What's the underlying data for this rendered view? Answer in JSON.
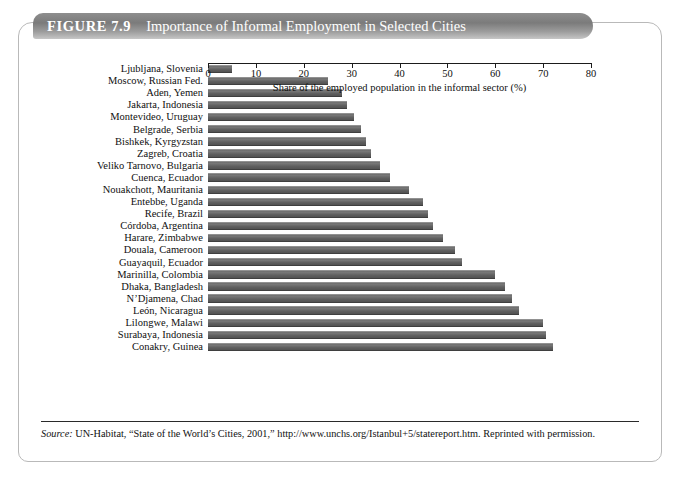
{
  "figure": {
    "label": "FIGURE 7.9",
    "title": "Importance of Informal Employment in Selected Cities"
  },
  "source": {
    "prefix": "Source:",
    "text": " UN-Habitat, “State of the World’s Cities, 2001,” http://www.unchs.org/Istanbul+5/statereport.htm. Reprinted with permission."
  },
  "colors": {
    "bar": "#666666",
    "banner_dark": "#7b7b7b",
    "banner_light": "#c6c6c6",
    "axis": "#1b1b1b",
    "card_border": "#b9b9b9"
  },
  "chart_data": {
    "type": "bar",
    "orientation": "horizontal",
    "title": "Importance of Informal Employment in Selected Cities",
    "xlabel": "Share of the employed population in the informal sector (%)",
    "ylabel": "",
    "xlim": [
      0,
      80
    ],
    "xticks": [
      0,
      10,
      20,
      30,
      40,
      50,
      60,
      70,
      80
    ],
    "grid": false,
    "legend": false,
    "categories": [
      "Ljubljana, Slovenia",
      "Moscow, Russian Fed.",
      "Aden, Yemen",
      "Jakarta, Indonesia",
      "Montevideo, Uruguay",
      "Belgrade, Serbia",
      "Bishkek, Kyrgyzstan",
      "Zagreb, Croatia",
      "Veliko Tarnovo, Bulgaria",
      "Cuenca, Ecuador",
      "Nouakchott, Mauritania",
      "Entebbe, Uganda",
      "Recife, Brazil",
      "Córdoba, Argentina",
      "Harare, Zimbabwe",
      "Douala, Cameroon",
      "Guayaquil, Ecuador",
      "Marinilla, Colombia",
      "Dhaka, Bangladesh",
      "N’Djamena, Chad",
      "León, Nicaragua",
      "Lilongwe, Malawi",
      "Surabaya, Indonesia",
      "Conakry, Guinea"
    ],
    "values": [
      5,
      25,
      28,
      29,
      30.5,
      32,
      33,
      34,
      36,
      38,
      42,
      45,
      46,
      47,
      49,
      51.5,
      53,
      60,
      62,
      63.5,
      65,
      70,
      70.5,
      72
    ]
  }
}
